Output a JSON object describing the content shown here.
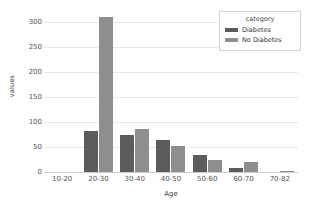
{
  "chart_data": {
    "type": "bar",
    "title": "",
    "xlabel": "Age",
    "ylabel": "values",
    "categories": [
      "10-20",
      "20-30",
      "30-40",
      "40-50",
      "50-60",
      "60-70",
      "70-82"
    ],
    "series": [
      {
        "name": "Diabetes",
        "color": "#5c5c5c",
        "values": [
          0,
          82,
          75,
          64,
          35,
          9,
          0
        ]
      },
      {
        "name": "No Diabetes",
        "color": "#8e8e8e",
        "values": [
          0,
          310,
          87,
          52,
          24,
          21,
          3
        ]
      }
    ],
    "ylim": [
      0,
      320
    ],
    "yticks": [
      0,
      50,
      100,
      150,
      200,
      250,
      300
    ],
    "grid": true,
    "legend": {
      "title": "category",
      "position": "upper-right"
    }
  }
}
